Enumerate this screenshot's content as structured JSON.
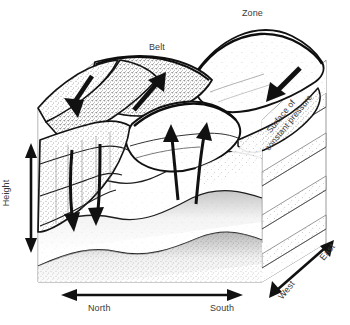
{
  "figure": {
    "background_color": "#ffffff",
    "ink_color": "#1a1a1a",
    "label_color": "#3a3a3a",
    "box_edge_color": "#8a8a8a"
  },
  "labels": {
    "zone": "Zone",
    "belt": "Belt",
    "north": "North",
    "south": "South",
    "east": "East",
    "west": "West",
    "height": "Height",
    "surface_line1": "Surface of",
    "surface_line2": "constant pressure"
  },
  "axes": [
    {
      "name": "height",
      "label": "Height",
      "orientation": "vertical",
      "arrow": "double"
    },
    {
      "name": "north-south",
      "label_low": "North",
      "label_high": "South",
      "orientation": "horizontal",
      "arrow": "double"
    },
    {
      "name": "east-west",
      "label_low": "West",
      "label_high": "East",
      "orientation": "diagonal-depth",
      "arrow": "double"
    }
  ],
  "features": [
    {
      "name": "zone-cloud",
      "label": "Zone",
      "motion": "rising",
      "position": "upper-right"
    },
    {
      "name": "belt-cloud",
      "label": "Belt",
      "motion": "sinking",
      "position": "upper-center"
    }
  ],
  "flow_arrows": [
    {
      "name": "belt-sinking-arrow-left",
      "direction": "down-left",
      "region": "belt"
    },
    {
      "name": "zone-rising-arrow-center",
      "direction": "up-right",
      "region": "zone"
    },
    {
      "name": "belt-sinking-arrow-right",
      "direction": "down-left",
      "region": "belt"
    },
    {
      "name": "zone-updraft-arrow-1",
      "direction": "up",
      "region": "zone-interior"
    },
    {
      "name": "zone-updraft-arrow-2",
      "direction": "up",
      "region": "zone-interior"
    },
    {
      "name": "belt-downdraft-arrow-1",
      "direction": "down",
      "region": "belt-interior"
    },
    {
      "name": "belt-downdraft-arrow-2",
      "direction": "down",
      "region": "belt-interior"
    }
  ],
  "isobaric_surfaces": {
    "label": "Surface of constant pressure",
    "count": 4
  }
}
